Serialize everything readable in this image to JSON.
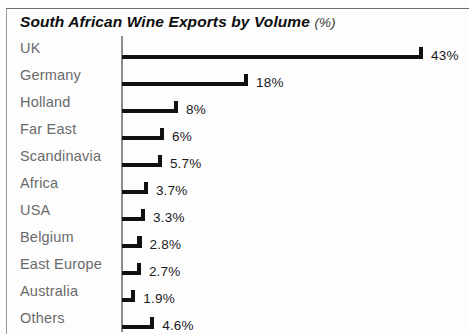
{
  "chart_data": {
    "type": "bar",
    "orientation": "horizontal",
    "title": "South African Wine Exports by Volume",
    "title_unit": "(%)",
    "xlabel": "",
    "ylabel": "",
    "grid": false,
    "legend": false,
    "axis_line": "vertical-left",
    "value_suffix": "%",
    "xlim": [
      0,
      43
    ],
    "categories": [
      "UK",
      "Germany",
      "Holland",
      "Far East",
      "Scandinavia",
      "Africa",
      "USA",
      "Belgium",
      "East Europe",
      "Australia",
      "Others"
    ],
    "values": [
      43,
      18,
      8,
      6,
      5.7,
      3.7,
      3.3,
      2.8,
      2.7,
      1.9,
      4.6
    ],
    "value_labels": [
      "43%",
      "18%",
      "8%",
      "6%",
      "5.7%",
      "3.7%",
      "3.3%",
      "2.8%",
      "2.7%",
      "1.9%",
      "4.6%"
    ],
    "colors": {
      "bar": "#111111",
      "axis": "#8d8d8d",
      "category_label": "#6a6a6a",
      "value_label": "#1a1a1a",
      "title": "#0d0d0d",
      "background": "#fdfdfd",
      "frame": "#6b6b6b"
    }
  }
}
